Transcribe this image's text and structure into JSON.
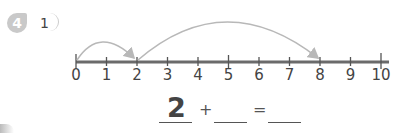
{
  "problem": {
    "number": "4",
    "sub_number": "1"
  },
  "number_line": {
    "min": 0,
    "max": 10,
    "labels": [
      "0",
      "1",
      "2",
      "3",
      "4",
      "5",
      "6",
      "7",
      "8",
      "9",
      "10"
    ],
    "jumps": [
      {
        "from": 0,
        "to": 2
      },
      {
        "from": 2,
        "to": 8
      }
    ],
    "colors": {
      "line": "#6b6b6b",
      "arc": "#b8b8b8"
    }
  },
  "equation": {
    "first_addend": "2",
    "plus": "+",
    "second_addend": "",
    "equals": "=",
    "sum": ""
  }
}
